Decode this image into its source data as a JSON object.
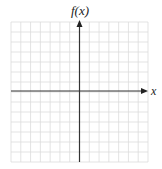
{
  "diagram": {
    "type": "cartesian-coordinate-grid",
    "axes": {
      "x_label": "x",
      "y_label": "f(x)"
    },
    "grid": {
      "columns": 14,
      "rows": 14,
      "cells_left_of_y_axis": 7,
      "cells_right_of_y_axis": 7,
      "cells_above_x_axis": 7,
      "cells_below_x_axis": 7,
      "line_color": "#dcdcdc"
    },
    "axis_color": "#333333",
    "arrows": [
      "positive-x",
      "positive-y"
    ]
  }
}
